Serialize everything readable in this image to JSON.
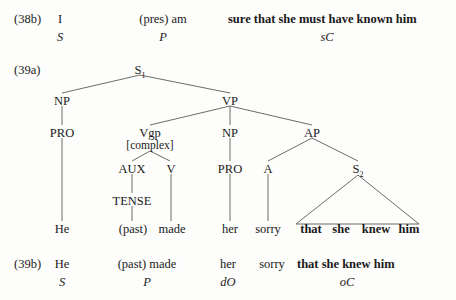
{
  "figure": {
    "caption_38b": "(38b)",
    "caption_39a": "(39a)",
    "caption_39b": "(39b)",
    "ink_color": "#1a1a1a",
    "line_color": "#5a5a56",
    "background_color": "#fdfdfb"
  },
  "example_38b": {
    "label": "(38b)",
    "segments": [
      {
        "text": "I",
        "function": "S",
        "bold": false
      },
      {
        "text": "(pres) am",
        "function": "P",
        "bold": false
      },
      {
        "text": "sure that she must have known him",
        "function": "sC",
        "bold": true
      }
    ]
  },
  "example_39a": {
    "label": "(39a)",
    "tree": {
      "nodes": [
        {
          "id": "S1",
          "label": "S",
          "subscript": "1"
        },
        {
          "id": "NP1",
          "label": "NP",
          "subscript": ""
        },
        {
          "id": "VP",
          "label": "VP",
          "subscript": ""
        },
        {
          "id": "PRO1",
          "label": "PRO",
          "subscript": ""
        },
        {
          "id": "Vgp",
          "label": "Vgp",
          "subscript": ""
        },
        {
          "id": "Vgp_feature",
          "label": "[complex]",
          "subscript": ""
        },
        {
          "id": "NP2",
          "label": "NP",
          "subscript": ""
        },
        {
          "id": "AP",
          "label": "AP",
          "subscript": ""
        },
        {
          "id": "AUX",
          "label": "AUX",
          "subscript": ""
        },
        {
          "id": "V",
          "label": "V",
          "subscript": ""
        },
        {
          "id": "PRO2",
          "label": "PRO",
          "subscript": ""
        },
        {
          "id": "A",
          "label": "A",
          "subscript": ""
        },
        {
          "id": "S2",
          "label": "S",
          "subscript": "2"
        },
        {
          "id": "TENSE",
          "label": "TENSE",
          "subscript": ""
        }
      ],
      "terminals": [
        {
          "text": "He",
          "bold": false
        },
        {
          "text": "(past)",
          "bold": false
        },
        {
          "text": "made",
          "bold": false
        },
        {
          "text": "her",
          "bold": false
        },
        {
          "text": "sorry",
          "bold": false
        },
        {
          "text": "that",
          "bold": true
        },
        {
          "text": "she",
          "bold": true
        },
        {
          "text": "knew",
          "bold": true
        },
        {
          "text": "him",
          "bold": true
        }
      ]
    }
  },
  "example_39b": {
    "label": "(39b)",
    "segments": [
      {
        "text": "He",
        "function": "S",
        "bold": false
      },
      {
        "text": "(past) made",
        "function": "P",
        "bold": false
      },
      {
        "text": "her",
        "function": "dO",
        "bold": false
      },
      {
        "text": "sorry",
        "function": "",
        "bold": false
      },
      {
        "text": "that she knew him",
        "function": "oC",
        "bold": true
      }
    ]
  }
}
